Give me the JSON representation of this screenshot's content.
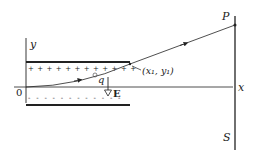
{
  "diagram": {
    "labels": {
      "y_axis": "y",
      "x_axis": "x",
      "origin": "0",
      "charge": "q",
      "field": "E",
      "exit_point": "(x₁, y₁)",
      "screen_point": "P",
      "screen": "S"
    },
    "upper_plate_charge": "+ + + + + + + + + + + +",
    "lower_plate_charge": "- - - - - - - - - - - -",
    "colors": {
      "line": "#222222",
      "background": "#ffffff"
    }
  }
}
